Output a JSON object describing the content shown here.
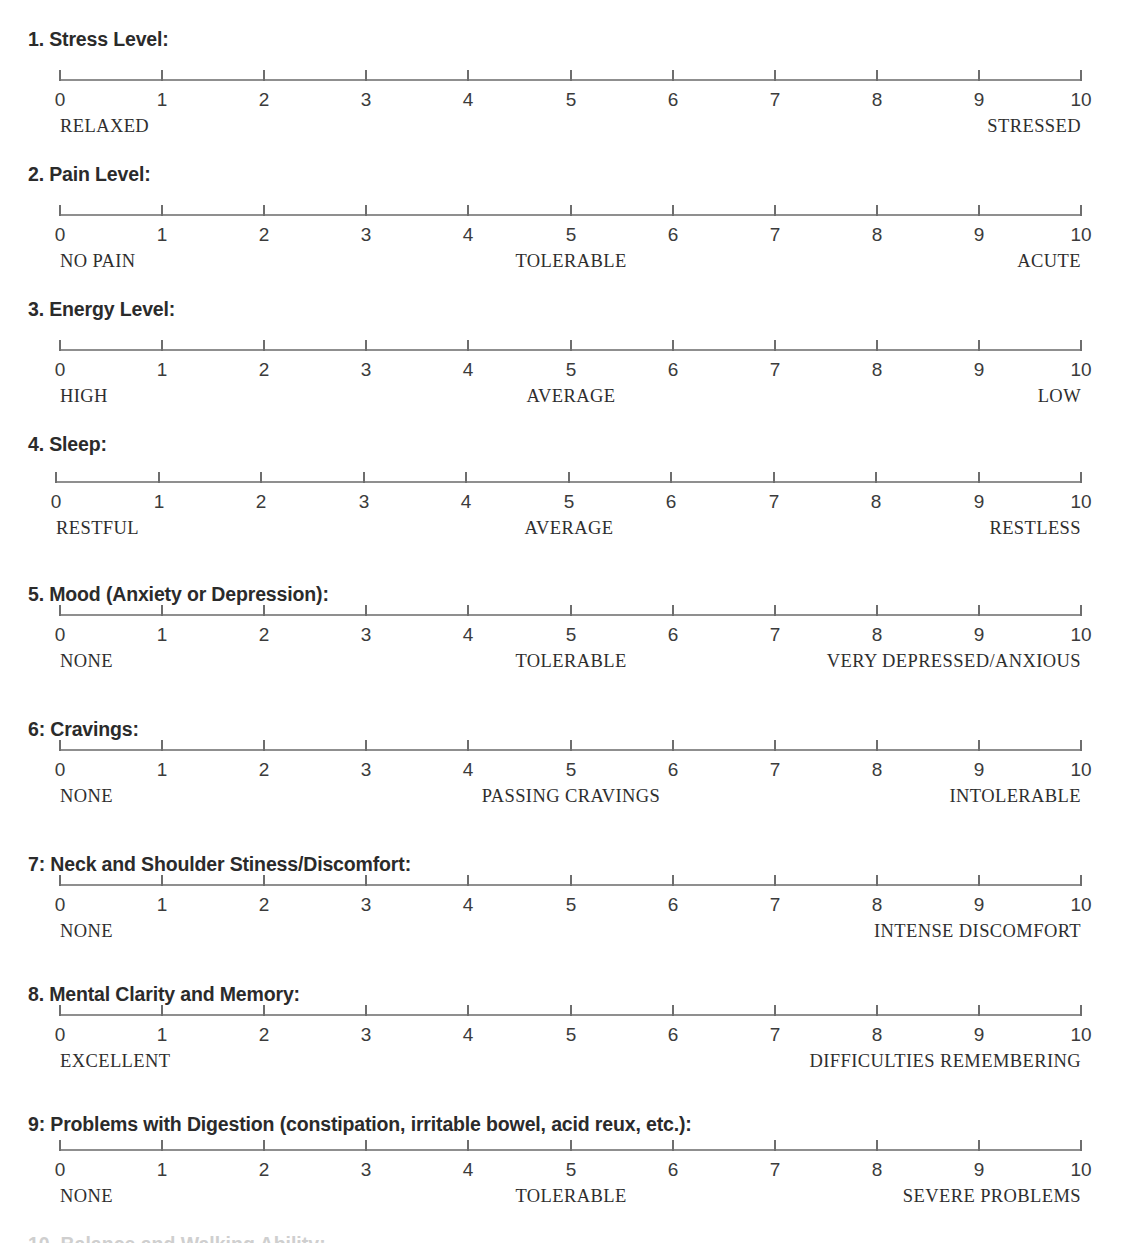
{
  "document": {
    "type": "rating-scale-questionnaire",
    "scale_min": 0,
    "scale_max": 10,
    "tick_numbers": [
      "0",
      "1",
      "2",
      "3",
      "4",
      "5",
      "6",
      "7",
      "8",
      "9",
      "10"
    ],
    "bottom_cut_text": "10. Balance and Walking Ability:"
  },
  "items": [
    {
      "heading": "1. Stress Level:",
      "anchor_left": "RELAXED",
      "anchor_center": "",
      "anchor_center_at": 5,
      "anchor_right": "STRESSED"
    },
    {
      "heading": "2. Pain Level:",
      "anchor_left": "NO PAIN",
      "anchor_center": "TOLERABLE",
      "anchor_center_at": 5,
      "anchor_right": "ACUTE"
    },
    {
      "heading": "3. Energy Level:",
      "anchor_left": "HIGH",
      "anchor_center": "AVERAGE",
      "anchor_center_at": 5,
      "anchor_right": "LOW"
    },
    {
      "heading": "4. Sleep:",
      "anchor_left": "RESTFUL",
      "anchor_center": "AVERAGE",
      "anchor_center_at": 5,
      "anchor_right": "RESTLESS"
    },
    {
      "heading": "5. Mood (Anxiety or Depression):",
      "anchor_left": "NONE",
      "anchor_center": "TOLERABLE",
      "anchor_center_at": 5,
      "anchor_right": "VERY DEPRESSED/ANXIOUS"
    },
    {
      "heading": "6: Cravings:",
      "anchor_left": "NONE",
      "anchor_center": "PASSING CRAVINGS",
      "anchor_center_at": 5,
      "anchor_right": "INTOLERABLE"
    },
    {
      "heading": "7: Neck and Shoulder Stiness/Discomfort:",
      "anchor_left": "NONE",
      "anchor_center": "",
      "anchor_center_at": 5,
      "anchor_right": "INTENSE DISCOMFORT"
    },
    {
      "heading": "8. Mental Clarity and Memory:",
      "anchor_left": "EXCELLENT",
      "anchor_center": "",
      "anchor_center_at": 5,
      "anchor_right": "DIFFICULTIES REMEMBERING"
    },
    {
      "heading": "9: Problems with Digestion (constipation, irritable bowel, acid reux, etc.):",
      "anchor_left": "NONE",
      "anchor_center": "TOLERABLE",
      "anchor_center_at": 5,
      "anchor_right": "SEVERE PROBLEMS"
    }
  ],
  "layout": {
    "item_tops": [
      28,
      163,
      298,
      433,
      583,
      718,
      853,
      983,
      1113
    ],
    "scale_tops": [
      70,
      205,
      340,
      472,
      605,
      740,
      875,
      1005,
      1140
    ],
    "scale_lefts": [
      60,
      60,
      60,
      56,
      60,
      60,
      60,
      60,
      60
    ],
    "scale_right": 1081
  }
}
